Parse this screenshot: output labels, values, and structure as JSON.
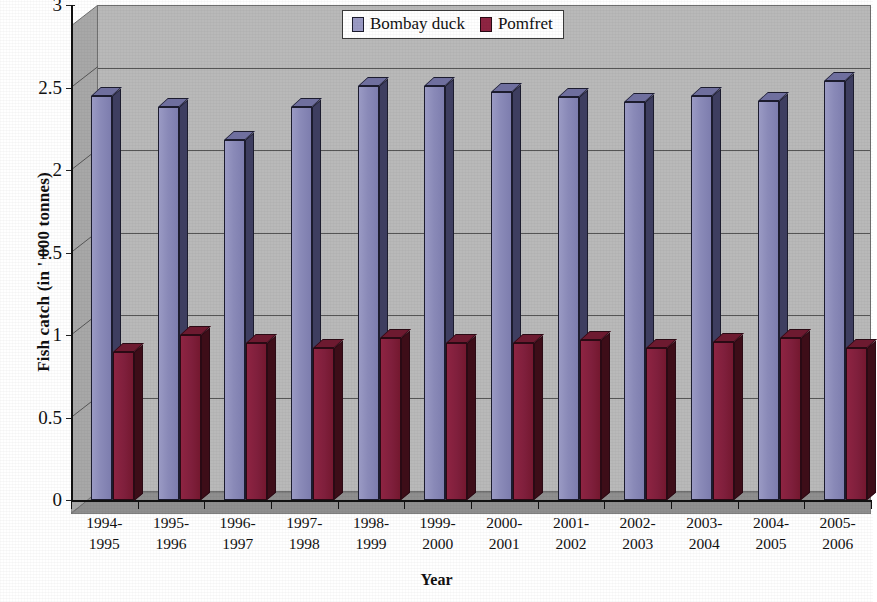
{
  "chart_data": {
    "type": "bar",
    "title": "",
    "xlabel": "Year",
    "ylabel": "Fish catch (in ' 000 tonnes)",
    "categories": [
      "1994-1995",
      "1995-1996",
      "1996-1997",
      "1997-1998",
      "1998-1999",
      "1999-2000",
      "2000-2001",
      "2001-2002",
      "2002-2003",
      "2003-2004",
      "2004-2005",
      "2005-2006"
    ],
    "category_lines": [
      [
        "1994-",
        "1995"
      ],
      [
        "1995-",
        "1996"
      ],
      [
        "1996-",
        "1997"
      ],
      [
        "1997-",
        "1998"
      ],
      [
        "1998-",
        "1999"
      ],
      [
        "1999-",
        "2000"
      ],
      [
        "2000-",
        "2001"
      ],
      [
        "2001-",
        "2002"
      ],
      [
        "2002-",
        "2003"
      ],
      [
        "2003-",
        "2004"
      ],
      [
        "2004-",
        "2005"
      ],
      [
        "2005-",
        "2006"
      ]
    ],
    "series": [
      {
        "name": "Bombay duck",
        "color": "#8a8ab8",
        "values": [
          2.45,
          2.38,
          2.18,
          2.38,
          2.51,
          2.51,
          2.47,
          2.44,
          2.41,
          2.45,
          2.42,
          2.54
        ]
      },
      {
        "name": "Pomfret",
        "color": "#8e2442",
        "values": [
          0.9,
          1.0,
          0.95,
          0.92,
          0.98,
          0.95,
          0.95,
          0.97,
          0.92,
          0.96,
          0.98,
          0.92
        ]
      }
    ],
    "ylim": [
      0,
      3
    ],
    "y_ticks": [
      0,
      0.5,
      1,
      1.5,
      2,
      2.5,
      3
    ],
    "y_tick_labels": [
      "0",
      "0.5",
      "1",
      "1.5",
      "2",
      "2.5",
      "3"
    ],
    "grid": true,
    "legend_position": "top-center",
    "style": "3d-column"
  },
  "legend": {
    "items": [
      {
        "label": "Bombay duck",
        "swatch": "blue"
      },
      {
        "label": "Pomfret",
        "swatch": "red"
      }
    ]
  },
  "axes": {
    "y_title": "Fish catch (in ' 000 tonnes)",
    "x_title": "Year"
  }
}
